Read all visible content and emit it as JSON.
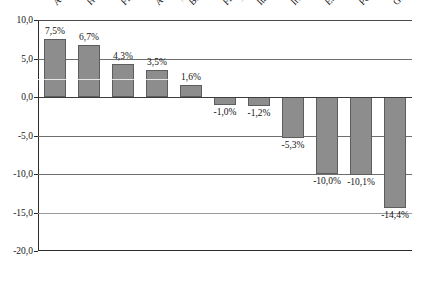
{
  "chart_data": {
    "type": "bar",
    "title": "(em % do PIB)",
    "xlabel": "",
    "ylabel": "",
    "ylim": [
      -20.0,
      10.0
    ],
    "grid": true,
    "legend": "none",
    "yticks": [
      "10,0",
      "5,0",
      "0,0",
      "-5,0",
      "-10,0",
      "-15,0",
      "-20,0"
    ],
    "ytick_values": [
      10.0,
      5.0,
      0.0,
      -5.0,
      -10.0,
      -15.0,
      -20.0
    ],
    "categories": [
      "Alemanha",
      "Holanda",
      "Finlândia",
      "Áustria",
      "Bélgica",
      "França",
      "Itália",
      "Irlanda",
      "Espanha",
      "Portugal",
      "Grécia"
    ],
    "values": [
      7.5,
      6.7,
      4.3,
      3.5,
      1.6,
      -1.0,
      -1.2,
      -5.3,
      -10.0,
      -10.1,
      -14.4
    ],
    "data_labels": [
      "7,5%",
      "6,7%",
      "4,3%",
      "3,5%",
      "1,6%",
      "-1,0%",
      "-1,2%",
      "-5,3%",
      "-10,0%",
      "-10,1%",
      "-14,4%"
    ],
    "colors": {
      "bar_fill": "#8d8d8d",
      "bar_stroke": "#5d5d5d",
      "gridline": "#6e6e6e",
      "axis": "#2b2b2b",
      "text": "#141414",
      "background": "#ffffff"
    }
  }
}
